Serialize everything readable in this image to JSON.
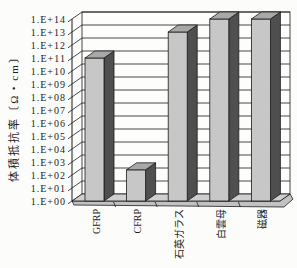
{
  "figure": {
    "background": "#fcfcfa"
  },
  "chart_data": {
    "type": "bar",
    "style": "3d-column",
    "title": "",
    "xlabel": "",
    "ylabel": "体積抵抗率〔Ω・cm〕",
    "categories": [
      "GFRP",
      "CFRP",
      "石英ガラス",
      "白雲母",
      "磁器"
    ],
    "values": [
      100000000000.0,
      250.0,
      10000000000000.0,
      100000000000000.0,
      100000000000000.0
    ],
    "y_scale": "log",
    "ylim_exponents": [
      0,
      14
    ],
    "grid": true,
    "legend": false,
    "y_ticks": [
      "1.E+00",
      "1.E+01",
      "1.E+02",
      "1.E+03",
      "1.E+04",
      "1.E+05",
      "1.E+06",
      "1.E+07",
      "1.E+08",
      "1.E+09",
      "1.E+10",
      "1.E+11",
      "1.E+12",
      "1.E+13",
      "1.E+14"
    ],
    "colors": {
      "bar_front": "#c7c7c7",
      "bar_top": "#a8a8a8",
      "bar_side": "#4f4f4f",
      "floor_top": "#cfcfcf",
      "floor_side": "#c2c2c2",
      "wall": "#fdfdfc",
      "line": "#1a1a1a"
    }
  }
}
